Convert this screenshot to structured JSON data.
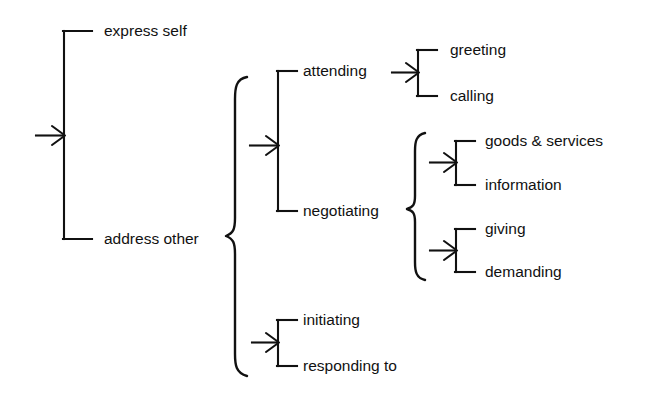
{
  "diagram": {
    "type": "system-network",
    "background_color": "#ffffff",
    "line_color": "#111111",
    "entry": {
      "name": "entry-arrow",
      "connector": "square-bracket"
    },
    "systems": [
      {
        "id": "speech-role",
        "connector": "square-bracket",
        "features": [
          {
            "id": "express-self",
            "label": "express self"
          },
          {
            "id": "address-other",
            "label": "address other"
          }
        ]
      },
      {
        "id": "address-other-subtypes",
        "connector": "curly-brace",
        "source": "address other",
        "features": []
      },
      {
        "id": "orientation",
        "connector": "square-bracket",
        "features": [
          {
            "id": "attending",
            "label": "attending"
          },
          {
            "id": "negotiating",
            "label": "negotiating"
          }
        ]
      },
      {
        "id": "attending-type",
        "connector": "square-bracket",
        "source": "attending",
        "features": [
          {
            "id": "greeting",
            "label": "greeting"
          },
          {
            "id": "calling",
            "label": "calling"
          }
        ]
      },
      {
        "id": "negotiating-subtypes",
        "connector": "curly-brace",
        "source": "negotiating",
        "features": []
      },
      {
        "id": "commodity",
        "connector": "square-bracket",
        "features": [
          {
            "id": "goods-services",
            "label": "goods & services"
          },
          {
            "id": "information",
            "label": "information"
          }
        ]
      },
      {
        "id": "exchange-role",
        "connector": "square-bracket",
        "features": [
          {
            "id": "giving",
            "label": "giving"
          },
          {
            "id": "demanding",
            "label": "demanding"
          }
        ]
      },
      {
        "id": "initiation",
        "connector": "square-bracket",
        "features": [
          {
            "id": "initiating",
            "label": "initiating"
          },
          {
            "id": "responding-to",
            "label": "responding to"
          }
        ]
      }
    ],
    "labels": {
      "express_self": "express self",
      "address_other": "address other",
      "attending": "attending",
      "negotiating": "negotiating",
      "greeting": "greeting",
      "calling": "calling",
      "goods_services": "goods & services",
      "information": "information",
      "giving": "giving",
      "demanding": "demanding",
      "initiating": "initiating",
      "responding_to": "responding to"
    }
  }
}
